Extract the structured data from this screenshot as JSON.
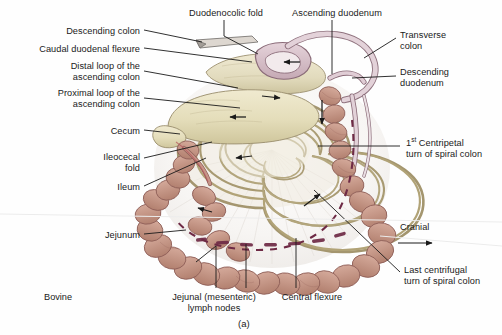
{
  "figure": {
    "species_caption": "Bovine",
    "panel_letter": "(a)",
    "orientation": {
      "label": "Cranial",
      "arrow": "right-arrow"
    }
  },
  "labels": {
    "left": [
      {
        "id": "descending-colon",
        "text": "Descending colon",
        "x": 8,
        "y": 26,
        "w": 132,
        "align": "right"
      },
      {
        "id": "caudal-duodenal-flexure",
        "text": "Caudal duodenal flexure",
        "x": 2,
        "y": 44,
        "w": 138,
        "align": "right"
      },
      {
        "id": "distal-loop",
        "text": "Distal loop of the\nascending colon",
        "x": 18,
        "y": 61,
        "w": 122,
        "align": "right"
      },
      {
        "id": "proximal-loop",
        "text": "Proximal loop of the\nascending colon",
        "x": 12,
        "y": 88,
        "w": 128,
        "align": "right"
      },
      {
        "id": "cecum",
        "text": "Cecum",
        "x": 88,
        "y": 126,
        "w": 52,
        "align": "right"
      },
      {
        "id": "ileocecal-fold",
        "text": "Ileocecal\nfold",
        "x": 76,
        "y": 152,
        "w": 64,
        "align": "right"
      },
      {
        "id": "ileum",
        "text": "Ileum",
        "x": 88,
        "y": 182,
        "w": 52,
        "align": "right"
      },
      {
        "id": "jejunum",
        "text": "Jejunum",
        "x": 78,
        "y": 230,
        "w": 62,
        "align": "right"
      }
    ],
    "top": [
      {
        "id": "duodenocolic-fold",
        "text": "Duodenocolic fold",
        "x": 178,
        "y": 8,
        "w": 96,
        "align": "center"
      },
      {
        "id": "ascending-duodenum",
        "text": "Ascending duodenum",
        "x": 282,
        "y": 8,
        "w": 110,
        "align": "center"
      }
    ],
    "right": [
      {
        "id": "transverse-colon",
        "text": "Transverse\ncolon",
        "x": 400,
        "y": 30,
        "w": 96,
        "align": "left"
      },
      {
        "id": "descending-duodenum",
        "text": "Descending\nduodenum",
        "x": 400,
        "y": 67,
        "w": 96,
        "align": "left"
      },
      {
        "id": "first-centripetal-turn",
        "text_pre": "1",
        "text_sup": "st",
        "text_post": " Centripetal\nturn of spiral colon",
        "x": 406,
        "y": 138,
        "w": 96,
        "align": "left"
      },
      {
        "id": "last-centrifugal-turn",
        "text": "Last centrifugal\nturn of spiral colon",
        "x": 404,
        "y": 265,
        "w": 98,
        "align": "left"
      }
    ],
    "bottom": [
      {
        "id": "jejunal-lymph-nodes",
        "text": "Jejunal (mesenteric)\nlymph nodes",
        "x": 160,
        "y": 292,
        "w": 108,
        "align": "center"
      },
      {
        "id": "central-flexure",
        "text": "Central flexure",
        "x": 272,
        "y": 292,
        "w": 80,
        "align": "center"
      }
    ]
  },
  "colors": {
    "line": "#1a1a1a",
    "text": "#1a1a1a",
    "background": "#fefefe",
    "cecum_fill": "#e8e2c0",
    "cecum_shade": "#d6cfa4",
    "colon_loop_fill": "#e6e0c6",
    "duodenum_fill": "#d8c3cc",
    "duodenum_stroke": "#8a6b78",
    "jejunum_fill": "#c79588",
    "jejunum_stroke": "#8f5f58",
    "lymph_node_fill": "#b58a8a",
    "mesentery_fill": "#f6f4f2",
    "dashed_marker": "#6e2a45",
    "spiral_stroke": "#a89a78",
    "spiral_fill": "#efeade"
  },
  "annotations": {
    "flow_arrows": [
      {
        "id": "arrow-ascending-duodenum",
        "dir": "left"
      },
      {
        "id": "arrow-distal-loop",
        "dir": "left"
      },
      {
        "id": "arrow-proximal-loop",
        "dir": "right"
      },
      {
        "id": "arrow-spiral-inner",
        "dir": "left"
      },
      {
        "id": "arrow-descending-duodenum",
        "dir": "down"
      },
      {
        "id": "arrow-centrifugal",
        "dir": "up-right"
      },
      {
        "id": "arrow-jejunum",
        "dir": "left"
      }
    ],
    "dashed_line_name": "centrifugal-boundary-dashed"
  }
}
